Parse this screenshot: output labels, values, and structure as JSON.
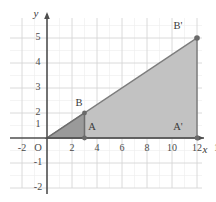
{
  "figure": {
    "axes": {
      "x_axis_label": "x",
      "y_axis_label": "y",
      "origin_label": "O",
      "x_ticks": [
        {
          "value": -2,
          "label": "-2"
        },
        {
          "value": 2,
          "label": "2"
        },
        {
          "value": 4,
          "label": "4"
        },
        {
          "value": 6,
          "label": "6"
        },
        {
          "value": 8,
          "label": "8"
        },
        {
          "value": 10,
          "label": "10"
        },
        {
          "value": 12,
          "label": "12"
        },
        {
          "value": 14,
          "label": "14"
        }
      ],
      "y_ticks": [
        {
          "value": 5,
          "label": "5"
        },
        {
          "value": 4,
          "label": "4"
        },
        {
          "value": 3,
          "label": "3"
        },
        {
          "value": 2,
          "label": "2"
        },
        {
          "value": 1,
          "label": "1"
        },
        {
          "value": -1,
          "label": "-1"
        },
        {
          "value": -2,
          "label": "-2"
        }
      ],
      "xlim": [
        -3,
        16
      ],
      "ylim": [
        -2.6,
        5.8
      ],
      "grid": true
    },
    "points": [
      {
        "name": "A",
        "label": "A",
        "x": 3,
        "y": 0,
        "marked": true
      },
      {
        "name": "B",
        "label": "B",
        "x": 3,
        "y": 1,
        "marked": true
      },
      {
        "name": "A-prime",
        "label": "A'",
        "x": 12,
        "y": 0,
        "marked": true
      },
      {
        "name": "B-prime",
        "label": "B'",
        "x": 12,
        "y": 4,
        "marked": true
      }
    ],
    "shapes": [
      {
        "name": "triangle-OAB",
        "vertices": [
          [
            0,
            0
          ],
          [
            3,
            0
          ],
          [
            3,
            1
          ]
        ],
        "fill": "#9a9a9a",
        "stroke": "#6e6e6e"
      },
      {
        "name": "triangle-OA-prime-B-prime",
        "vertices": [
          [
            0,
            0
          ],
          [
            12,
            0
          ],
          [
            12,
            4
          ]
        ],
        "fill": "#c2c2c2",
        "stroke": "#7b7b7b"
      }
    ],
    "colors": {
      "grid_minor": "#e8e8e8",
      "grid_major": "#d4d4d4",
      "axis": "#4f4f4f",
      "small_triangle_fill": "#9a9a9a",
      "large_triangle_fill": "#c2c2c2",
      "marker": "#6a6a6a",
      "background": "#ffffff"
    }
  }
}
